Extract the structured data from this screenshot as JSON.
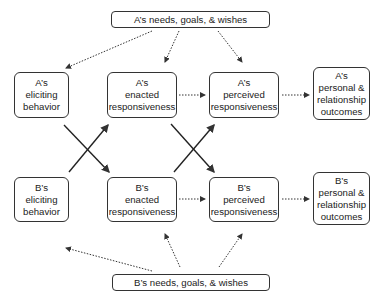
{
  "top_box": {
    "label": "A’s needs, goals, & wishes"
  },
  "bottom_box": {
    "label": "B’s needs, goals, & wishes"
  },
  "row_a": [
    {
      "lines": [
        "A’s",
        "eliciting",
        "behavior"
      ]
    },
    {
      "lines": [
        "A’s",
        "enacted",
        "responsiveness"
      ]
    },
    {
      "lines": [
        "A’s",
        "perceived",
        "responsiveness"
      ]
    },
    {
      "lines": [
        "A’s",
        "personal &",
        "relationship",
        "outcomes"
      ]
    }
  ],
  "row_b": [
    {
      "lines": [
        "B’s",
        "eliciting",
        "behavior"
      ]
    },
    {
      "lines": [
        "B’s",
        "enacted",
        "responsiveness"
      ]
    },
    {
      "lines": [
        "B’s",
        "perceived",
        "responsiveness"
      ]
    },
    {
      "lines": [
        "B’s",
        "personal &",
        "relationship",
        "outcomes"
      ]
    }
  ],
  "colors": {
    "line": "#333333",
    "background": "#ffffff"
  }
}
